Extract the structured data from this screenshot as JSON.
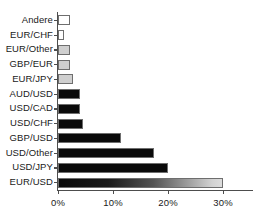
{
  "chart_data": {
    "type": "bar",
    "orientation": "horizontal",
    "title": "",
    "xlabel": "",
    "ylabel": "",
    "xlim": [
      0,
      32
    ],
    "grid": false,
    "legend": "none",
    "xticks": [
      "0%",
      "10%",
      "20%",
      "30%"
    ],
    "xtick_values": [
      0,
      10,
      20,
      30
    ],
    "categories": [
      "Andere",
      "EUR/CHF",
      "EUR/Other",
      "GBP/EUR",
      "EUR/JPY",
      "AUD/USD",
      "USD/CAD",
      "USD/CHF",
      "GBP/USD",
      "USD/Other",
      "USD/JPY",
      "EUR/USD"
    ],
    "values": [
      2.2,
      1.1,
      2.2,
      2.2,
      2.8,
      4.0,
      4.0,
      4.6,
      11.5,
      17.5,
      20.0,
      30.0
    ],
    "bar_styles": [
      "fill-white",
      "fill-white",
      "fill-lightgray",
      "fill-lightgray",
      "fill-lightgray",
      "fill-black",
      "fill-black",
      "fill-black",
      "fill-black",
      "fill-black",
      "fill-black",
      "fill-gradient"
    ],
    "colors": {
      "bar_black": "#0a0a0a",
      "bar_white": "#ffffff",
      "bar_lightgray": "#cfcfcf",
      "bar_outline": "#6e6e6e",
      "axis": "#4d4d4d",
      "text": "#1a1a1a",
      "background": "#ffffff"
    }
  }
}
